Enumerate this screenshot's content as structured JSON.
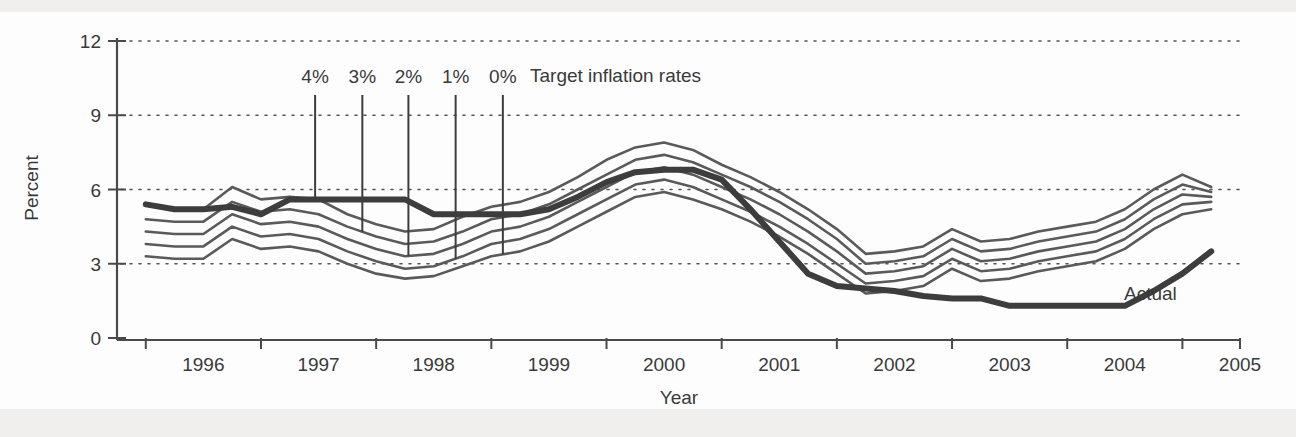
{
  "figure": {
    "background_color": "#fdfdfd",
    "scan_band_color": "#f0efed"
  },
  "chart_data": {
    "type": "line",
    "title": "",
    "xlabel": "Year",
    "ylabel": "Percent",
    "xlim": [
      1995.5,
      2005.25
    ],
    "ylim": [
      0,
      12
    ],
    "yticks": [
      0,
      3,
      6,
      9,
      12
    ],
    "ytick_labels": [
      "0",
      "3",
      "6",
      "9",
      "12"
    ],
    "xticks": [
      1996,
      1997,
      1998,
      1999,
      2000,
      2001,
      2002,
      2003,
      2004,
      2005
    ],
    "xtick_labels": [
      "1996",
      "1997",
      "1998",
      "1999",
      "2000",
      "2001",
      "2002",
      "2003",
      "2004",
      "2005"
    ],
    "grid": "horizontal-dotted",
    "legend_position": "inline-annotations",
    "x": [
      1995.75,
      1996.0,
      1996.25,
      1996.5,
      1996.75,
      1997.0,
      1997.25,
      1997.5,
      1997.75,
      1998.0,
      1998.25,
      1998.5,
      1998.75,
      1999.0,
      1999.25,
      1999.5,
      1999.75,
      2000.0,
      2000.25,
      2000.5,
      2000.75,
      2001.0,
      2001.25,
      2001.5,
      2001.75,
      2002.0,
      2002.25,
      2002.5,
      2002.75,
      2003.0,
      2003.25,
      2003.5,
      2003.75,
      2004.0,
      2004.25,
      2004.5,
      2004.75,
      2005.0
    ],
    "series": [
      {
        "name": "Target inflation 4%",
        "label": "4%",
        "kind": "band",
        "values": [
          5.4,
          5.2,
          5.2,
          6.1,
          5.6,
          5.7,
          5.6,
          5.0,
          4.6,
          4.3,
          4.4,
          4.9,
          5.3,
          5.5,
          5.9,
          6.5,
          7.2,
          7.7,
          7.9,
          7.6,
          7.0,
          6.5,
          5.9,
          5.2,
          4.4,
          3.4,
          3.5,
          3.7,
          4.4,
          3.9,
          4.0,
          4.3,
          4.5,
          4.7,
          5.2,
          6.0,
          6.6,
          6.1
        ]
      },
      {
        "name": "Target inflation 3%",
        "label": "3%",
        "kind": "band",
        "values": [
          4.8,
          4.7,
          4.7,
          5.5,
          5.1,
          5.2,
          5.0,
          4.5,
          4.1,
          3.8,
          3.9,
          4.3,
          4.8,
          5.0,
          5.4,
          6.0,
          6.6,
          7.2,
          7.4,
          7.1,
          6.6,
          6.1,
          5.5,
          4.8,
          4.0,
          3.0,
          3.1,
          3.3,
          4.0,
          3.5,
          3.6,
          3.9,
          4.1,
          4.3,
          4.8,
          5.6,
          6.2,
          5.9
        ]
      },
      {
        "name": "Target inflation 2%",
        "label": "2%",
        "kind": "band",
        "values": [
          4.3,
          4.2,
          4.2,
          5.0,
          4.6,
          4.7,
          4.5,
          4.0,
          3.6,
          3.3,
          3.4,
          3.8,
          4.3,
          4.5,
          4.9,
          5.5,
          6.1,
          6.7,
          6.9,
          6.6,
          6.1,
          5.6,
          5.0,
          4.3,
          3.5,
          2.6,
          2.7,
          2.9,
          3.6,
          3.1,
          3.2,
          3.5,
          3.7,
          3.9,
          4.4,
          5.2,
          5.8,
          5.7
        ]
      },
      {
        "name": "Target inflation 1%",
        "label": "1%",
        "kind": "band",
        "values": [
          3.8,
          3.7,
          3.7,
          4.5,
          4.1,
          4.2,
          4.0,
          3.5,
          3.1,
          2.8,
          2.9,
          3.3,
          3.8,
          4.0,
          4.4,
          5.0,
          5.6,
          6.2,
          6.4,
          6.1,
          5.6,
          5.1,
          4.5,
          3.8,
          3.0,
          2.2,
          2.3,
          2.5,
          3.2,
          2.7,
          2.8,
          3.1,
          3.3,
          3.5,
          4.0,
          4.8,
          5.4,
          5.5
        ]
      },
      {
        "name": "Target inflation 0%",
        "label": "0%",
        "kind": "band",
        "values": [
          3.3,
          3.2,
          3.2,
          4.0,
          3.6,
          3.7,
          3.5,
          3.0,
          2.6,
          2.4,
          2.5,
          2.9,
          3.3,
          3.5,
          3.9,
          4.5,
          5.1,
          5.7,
          5.9,
          5.6,
          5.2,
          4.7,
          4.1,
          3.4,
          2.6,
          1.8,
          1.9,
          2.1,
          2.8,
          2.3,
          2.4,
          2.7,
          2.9,
          3.1,
          3.6,
          4.4,
          5.0,
          5.2
        ]
      },
      {
        "name": "Actual",
        "label": "Actual",
        "kind": "actual",
        "values": [
          5.4,
          5.2,
          5.2,
          5.3,
          5.0,
          5.6,
          5.6,
          5.6,
          5.6,
          5.6,
          5.0,
          5.0,
          5.0,
          5.0,
          5.2,
          5.7,
          6.3,
          6.7,
          6.8,
          6.8,
          6.4,
          5.2,
          3.9,
          2.6,
          2.1,
          2.0,
          1.9,
          1.7,
          1.6,
          1.6,
          1.3,
          1.3,
          1.3,
          1.3,
          1.3,
          1.9,
          2.6,
          3.5
        ]
      }
    ],
    "annotations": {
      "legend_text": "Target inflation rates",
      "actual_label": "Actual",
      "pct_labels": [
        {
          "label": "4%",
          "x": 1997.22,
          "band_index": 0
        },
        {
          "label": "3%",
          "x": 1997.63,
          "band_index": 1
        },
        {
          "label": "2%",
          "x": 1998.03,
          "band_index": 2
        },
        {
          "label": "1%",
          "x": 1998.44,
          "band_index": 3
        },
        {
          "label": "0%",
          "x": 1998.85,
          "band_index": 4
        }
      ]
    }
  }
}
